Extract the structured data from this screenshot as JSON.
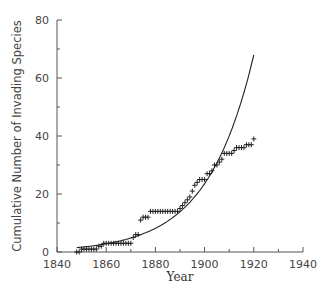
{
  "chart_data": {
    "type": "scatter",
    "title": "",
    "xlabel": "Year",
    "ylabel": "Cumulative Number of Invading Species",
    "xlim": [
      1840,
      1940
    ],
    "ylim": [
      0,
      80
    ],
    "x_ticks": [
      1840,
      1860,
      1880,
      1900,
      1920,
      1940
    ],
    "x_minor_ticks": [
      1850,
      1870,
      1890,
      1910,
      1930
    ],
    "y_ticks": [
      0,
      20,
      40,
      60,
      80
    ],
    "y_minor_ticks": [
      10,
      30,
      50,
      70
    ],
    "grid": false,
    "legend": null,
    "series": [
      {
        "name": "Observed cumulative species",
        "marker": "+",
        "x": [
          1848,
          1849,
          1850,
          1851,
          1852,
          1853,
          1854,
          1855,
          1856,
          1857,
          1858,
          1859,
          1860,
          1861,
          1862,
          1863,
          1864,
          1865,
          1866,
          1867,
          1868,
          1869,
          1870,
          1871,
          1872,
          1873,
          1874,
          1875,
          1876,
          1877,
          1878,
          1879,
          1880,
          1881,
          1882,
          1883,
          1884,
          1885,
          1886,
          1887,
          1888,
          1889,
          1890,
          1891,
          1892,
          1893,
          1894,
          1895,
          1896,
          1897,
          1898,
          1899,
          1900,
          1901,
          1902,
          1903,
          1904,
          1905,
          1906,
          1907,
          1908,
          1909,
          1910,
          1911,
          1912,
          1913,
          1914,
          1915,
          1916,
          1917,
          1918,
          1919,
          1920
        ],
        "y": [
          0,
          0,
          1,
          1,
          1,
          1,
          1,
          1,
          1,
          2,
          2,
          3,
          3,
          3,
          3,
          3,
          3,
          3,
          3,
          3,
          3,
          3,
          3,
          5,
          6,
          6,
          11,
          12,
          12,
          12,
          14,
          14,
          14,
          14,
          14,
          14,
          14,
          14,
          14,
          14,
          14,
          14,
          15,
          16,
          17,
          18,
          19,
          21,
          23,
          24,
          25,
          25,
          25,
          27,
          27,
          28,
          30,
          30,
          31,
          32,
          34,
          34,
          34,
          34,
          35,
          36,
          36,
          36,
          36,
          37,
          37,
          37,
          39
        ]
      },
      {
        "name": "Exponential fit",
        "line": true,
        "x": [
          1848,
          1855,
          1860,
          1865,
          1870,
          1875,
          1880,
          1885,
          1890,
          1895,
          1900,
          1905,
          1910,
          1915,
          1920
        ],
        "y": [
          1.5,
          2.2,
          2.8,
          3.7,
          4.8,
          6.3,
          8.2,
          10.7,
          14.0,
          18.2,
          23.8,
          31.0,
          40.4,
          52.6,
          68.0
        ]
      }
    ]
  }
}
